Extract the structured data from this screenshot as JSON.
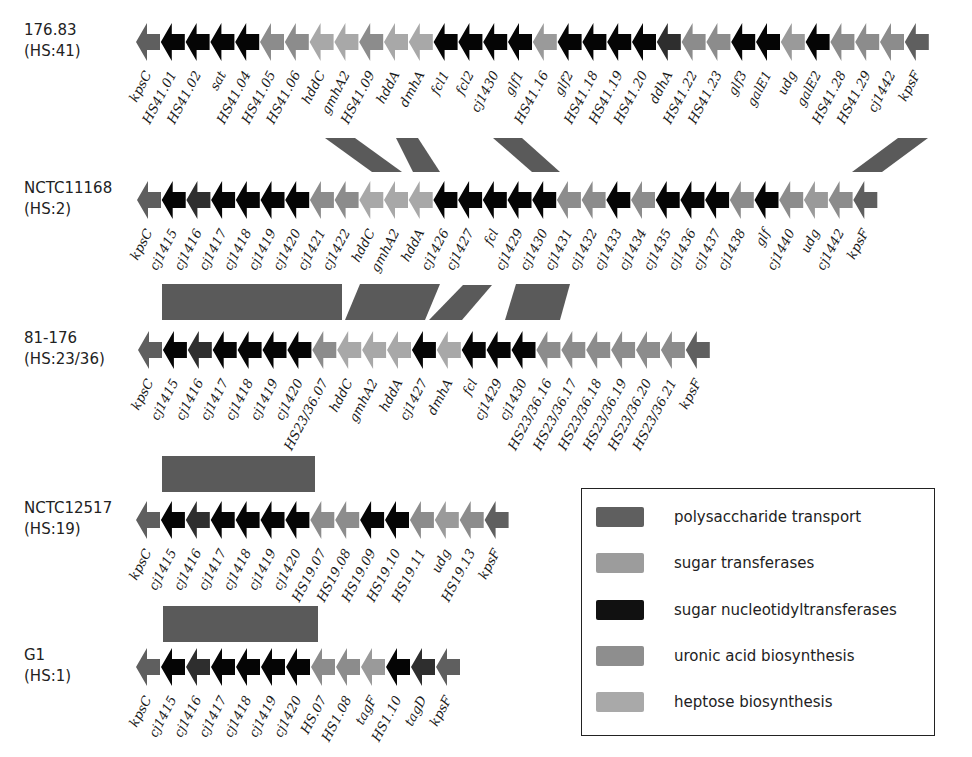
{
  "colors": {
    "polysaccharide_transport": "#5f5f5f",
    "sugar_transferases": "#9a9a9a",
    "sugar_nucleotidyltransferases": "#050505",
    "uronic_acid_biosynthesis": "#8c8c8c",
    "heptose_biosynthesis": "#a8a8a8",
    "dark_grey": "#2e2e2e",
    "band": "#5a5a5a"
  },
  "legend": {
    "items": [
      {
        "label": "polysaccharide transport",
        "color": "#5f5f5f"
      },
      {
        "label": "sugar transferases",
        "color": "#9c9c9c"
      },
      {
        "label": "sugar nucleotidyltransferases",
        "color": "#111111"
      },
      {
        "label": "uronic acid biosynthesis",
        "color": "#8e8e8e"
      },
      {
        "label": "heptose biosynthesis",
        "color": "#a9a9a9"
      }
    ]
  },
  "rows": [
    {
      "strain": "176.83",
      "serotype": "(HS:41)",
      "y": 42,
      "x0": 136,
      "pitch": 24.8,
      "genes": [
        {
          "name": "kpsC",
          "c": "P"
        },
        {
          "name": "HS41.01",
          "c": "N"
        },
        {
          "name": "HS41.02",
          "c": "N"
        },
        {
          "name": "sat",
          "c": "N"
        },
        {
          "name": "HS41.04",
          "c": "N"
        },
        {
          "name": "HS41.05",
          "c": "U"
        },
        {
          "name": "HS41.06",
          "c": "U"
        },
        {
          "name": "hddC",
          "c": "H"
        },
        {
          "name": "gmhA2",
          "c": "H"
        },
        {
          "name": "HS41.09",
          "c": "U"
        },
        {
          "name": "hddA",
          "c": "H"
        },
        {
          "name": "dmhA",
          "c": "H"
        },
        {
          "name": "fcl1",
          "c": "N"
        },
        {
          "name": "fcl2",
          "c": "N"
        },
        {
          "name": "cj1430",
          "c": "N"
        },
        {
          "name": "glf1",
          "c": "N"
        },
        {
          "name": "HS41.16",
          "c": "T"
        },
        {
          "name": "glf2",
          "c": "N"
        },
        {
          "name": "HS41.18",
          "c": "N"
        },
        {
          "name": "HS41.19",
          "c": "N"
        },
        {
          "name": "HS41.20",
          "c": "N"
        },
        {
          "name": "ddhA",
          "c": "D"
        },
        {
          "name": "HS41.22",
          "c": "U"
        },
        {
          "name": "HS41.23",
          "c": "U"
        },
        {
          "name": "glf3",
          "c": "N"
        },
        {
          "name": "galE1",
          "c": "N"
        },
        {
          "name": "udg",
          "c": "T"
        },
        {
          "name": "galE2",
          "c": "N"
        },
        {
          "name": "HS41.28",
          "c": "U"
        },
        {
          "name": "HS41.29",
          "c": "U"
        },
        {
          "name": "cj1442",
          "c": "U"
        },
        {
          "name": "kpsF",
          "c": "P"
        }
      ]
    },
    {
      "strain": "NCTC11168",
      "serotype": "(HS:2)",
      "y": 200,
      "x0": 137,
      "pitch": 24.7,
      "genes": [
        {
          "name": "kpsC",
          "c": "P"
        },
        {
          "name": "cj1415",
          "c": "N"
        },
        {
          "name": "cj1416",
          "c": "D"
        },
        {
          "name": "cj1417",
          "c": "N"
        },
        {
          "name": "cj1418",
          "c": "N"
        },
        {
          "name": "cj1419",
          "c": "N"
        },
        {
          "name": "cj1420",
          "c": "N"
        },
        {
          "name": "cj1421",
          "c": "U"
        },
        {
          "name": "cj1422",
          "c": "U"
        },
        {
          "name": "hddC",
          "c": "H"
        },
        {
          "name": "gmhA2",
          "c": "H"
        },
        {
          "name": "hddA",
          "c": "H"
        },
        {
          "name": "cj1426",
          "c": "N"
        },
        {
          "name": "cj1427",
          "c": "N"
        },
        {
          "name": "fcl",
          "c": "N"
        },
        {
          "name": "cj1429",
          "c": "N"
        },
        {
          "name": "cj1430",
          "c": "N"
        },
        {
          "name": "cj1431",
          "c": "U"
        },
        {
          "name": "cj1432",
          "c": "U"
        },
        {
          "name": "cj1433",
          "c": "N"
        },
        {
          "name": "cj1434",
          "c": "U"
        },
        {
          "name": "cj1435",
          "c": "N"
        },
        {
          "name": "cj1436",
          "c": "N"
        },
        {
          "name": "cj1437",
          "c": "N"
        },
        {
          "name": "cj1438",
          "c": "U"
        },
        {
          "name": "glf",
          "c": "N"
        },
        {
          "name": "cj1440",
          "c": "U"
        },
        {
          "name": "udg",
          "c": "T"
        },
        {
          "name": "cj1442",
          "c": "U"
        },
        {
          "name": "kpsF",
          "c": "P"
        }
      ]
    },
    {
      "strain": "81-176",
      "serotype": "(HS:23/36)",
      "y": 350,
      "x0": 138,
      "pitch": 24.9,
      "genes": [
        {
          "name": "kpsC",
          "c": "P"
        },
        {
          "name": "cj1415",
          "c": "N"
        },
        {
          "name": "cj1416",
          "c": "D"
        },
        {
          "name": "cj1417",
          "c": "N"
        },
        {
          "name": "cj1418",
          "c": "N"
        },
        {
          "name": "cj1419",
          "c": "N"
        },
        {
          "name": "cj1420",
          "c": "N"
        },
        {
          "name": "HS23/36.07",
          "c": "U"
        },
        {
          "name": "hddC",
          "c": "H"
        },
        {
          "name": "gmhA2",
          "c": "H"
        },
        {
          "name": "hddA",
          "c": "H"
        },
        {
          "name": "cj1427",
          "c": "N"
        },
        {
          "name": "dmhA",
          "c": "H"
        },
        {
          "name": "fcl",
          "c": "N"
        },
        {
          "name": "cj1429",
          "c": "N"
        },
        {
          "name": "cj1430",
          "c": "N"
        },
        {
          "name": "HS23/36.16",
          "c": "U"
        },
        {
          "name": "HS23/36.17",
          "c": "U"
        },
        {
          "name": "HS23/36.18",
          "c": "U"
        },
        {
          "name": "HS23/36.19",
          "c": "U"
        },
        {
          "name": "HS23/36.20",
          "c": "U"
        },
        {
          "name": "HS23/36.21",
          "c": "U"
        },
        {
          "name": "kpsF",
          "c": "P"
        }
      ]
    },
    {
      "strain": "NCTC12517",
      "serotype": "(HS:19)",
      "y": 520,
      "x0": 136,
      "pitch": 24.9,
      "genes": [
        {
          "name": "kpsC",
          "c": "P"
        },
        {
          "name": "cj1415",
          "c": "N"
        },
        {
          "name": "cj1416",
          "c": "D"
        },
        {
          "name": "cj1417",
          "c": "N"
        },
        {
          "name": "cj1418",
          "c": "N"
        },
        {
          "name": "cj1419",
          "c": "N"
        },
        {
          "name": "cj1420",
          "c": "N"
        },
        {
          "name": "HS19.07",
          "c": "U"
        },
        {
          "name": "HS19.08",
          "c": "U"
        },
        {
          "name": "HS19.09",
          "c": "N"
        },
        {
          "name": "HS19.10",
          "c": "N"
        },
        {
          "name": "HS19.11",
          "c": "U"
        },
        {
          "name": "udg",
          "c": "T"
        },
        {
          "name": "HS19.13",
          "c": "U"
        },
        {
          "name": "kpsF",
          "c": "P"
        }
      ]
    },
    {
      "strain": "G1",
      "serotype": "(HS:1)",
      "y": 667,
      "x0": 136,
      "pitch": 25.0,
      "genes": [
        {
          "name": "kpsC",
          "c": "P"
        },
        {
          "name": "cj1415",
          "c": "N"
        },
        {
          "name": "cj1416",
          "c": "D"
        },
        {
          "name": "cj1417",
          "c": "N"
        },
        {
          "name": "cj1418",
          "c": "N"
        },
        {
          "name": "cj1419",
          "c": "N"
        },
        {
          "name": "cj1420",
          "c": "N"
        },
        {
          "name": "HS.07",
          "c": "U"
        },
        {
          "name": "HS1.08",
          "c": "U"
        },
        {
          "name": "tagF",
          "c": "T"
        },
        {
          "name": "HS1.10",
          "c": "N"
        },
        {
          "name": "tagD",
          "c": "D"
        },
        {
          "name": "kpsF",
          "c": "P"
        }
      ]
    }
  ],
  "bands": [
    {
      "points": "325,138 355,138 402,172 372,172"
    },
    {
      "points": "396,138 418,138 440,172 413,172"
    },
    {
      "points": "493,138 522,138 560,172 532,172"
    },
    {
      "points": "852,172 882,172 928,138 898,138"
    },
    {
      "points": "162,284 342,284 342,320 162,320"
    },
    {
      "points": "360,284 440,284 425,320 345,320"
    },
    {
      "points": "463,285 492,285 462,320 429,320"
    },
    {
      "points": "516,284 570,284 560,320 505,320"
    },
    {
      "points": "162,456 315,456 315,492 162,492"
    },
    {
      "points": "163,606 318,606 318,642 163,642"
    }
  ]
}
